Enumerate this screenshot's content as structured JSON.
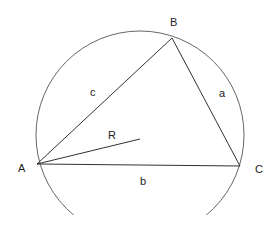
{
  "diagram": {
    "circle": {
      "cx": 140,
      "cy": 135,
      "r": 104,
      "stroke": "#666666"
    },
    "vertices": {
      "A": {
        "x": 37,
        "y": 164,
        "label": "A",
        "lx": 18,
        "ly": 172
      },
      "B": {
        "x": 172,
        "y": 38,
        "label": "B",
        "lx": 170,
        "ly": 26
      },
      "C": {
        "x": 240,
        "y": 166,
        "label": "C",
        "lx": 255,
        "ly": 173
      }
    },
    "sides": {
      "a": {
        "label": "a",
        "lx": 219,
        "ly": 97
      },
      "b": {
        "label": "b",
        "lx": 140,
        "ly": 185
      },
      "c": {
        "label": "c",
        "lx": 90,
        "ly": 96
      }
    },
    "radius": {
      "label": "R",
      "x2": 140,
      "y2": 139,
      "lx": 108,
      "ly": 139
    },
    "line_color": "#333333"
  }
}
